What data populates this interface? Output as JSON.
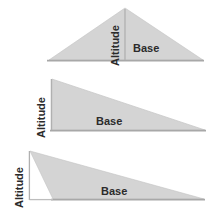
{
  "figure": {
    "background_color": "#ffffff",
    "triangle_fill_color": "#d4d4d4",
    "line_color": "#a8a8a8",
    "label_color": "#2b2b2b"
  },
  "diagrams": [
    {
      "id": "acute-triangle",
      "type": "acute",
      "description": "Acute triangle with altitude drawn inside from apex to base",
      "altitude_label": "Altitude",
      "base_label": "Base",
      "altitude_position": "interior",
      "vertices": [
        {
          "x": 49,
          "y": 60
        },
        {
          "x": 125,
          "y": 8
        },
        {
          "x": 203,
          "y": 60
        }
      ],
      "altitude_foot": {
        "x": 125,
        "y": 60
      }
    },
    {
      "id": "right-triangle",
      "type": "right",
      "description": "Right triangle where the altitude is the vertical leg",
      "altitude_label": "Altitude",
      "base_label": "Base",
      "altitude_position": "leg",
      "vertices": [
        {
          "x": 52,
          "y": 130
        },
        {
          "x": 52,
          "y": 79
        },
        {
          "x": 205,
          "y": 130
        }
      ],
      "altitude_foot": {
        "x": 52,
        "y": 130
      }
    },
    {
      "id": "obtuse-triangle",
      "type": "obtuse",
      "description": "Obtuse triangle with altitude falling outside the triangle to the left of the base",
      "altitude_label": "Altitude",
      "base_label": "Base",
      "altitude_position": "exterior",
      "vertices": [
        {
          "x": 53,
          "y": 199
        },
        {
          "x": 30,
          "y": 151
        },
        {
          "x": 204,
          "y": 199
        }
      ],
      "altitude_foot": {
        "x": 30,
        "y": 199
      }
    }
  ]
}
